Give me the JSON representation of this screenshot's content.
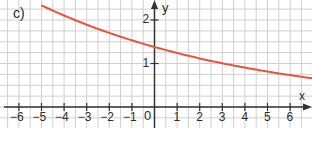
{
  "chart_data": {
    "type": "line",
    "title": "c)",
    "xlabel": "x",
    "ylabel": "y",
    "xlim": [
      -6.8,
      7.0
    ],
    "ylim": [
      0,
      2.45
    ],
    "x_ticks": [
      -6,
      -5,
      -4,
      -3,
      -2,
      -1,
      1,
      2,
      3,
      4,
      5,
      6
    ],
    "y_ticks": [
      1,
      2
    ],
    "origin_label": "0",
    "grid": true,
    "series": [
      {
        "name": "f(x)",
        "color": "#e8533a",
        "formula": "approx 1.38 * 0.9^x",
        "x": [
          -5,
          -4,
          -3,
          -2,
          -1,
          0,
          1,
          2,
          3,
          4,
          5,
          6,
          7
        ],
        "y": [
          2.34,
          2.1,
          1.89,
          1.7,
          1.53,
          1.38,
          1.24,
          1.12,
          1.01,
          0.91,
          0.81,
          0.73,
          0.66
        ]
      }
    ]
  },
  "labels": {
    "part": "c)",
    "x_axis": "x",
    "y_axis": "y",
    "origin": "0"
  },
  "colors": {
    "grid": "#cfcfcf",
    "axis": "#333333",
    "curve": "#e8533a",
    "text": "#2b2b2b"
  }
}
